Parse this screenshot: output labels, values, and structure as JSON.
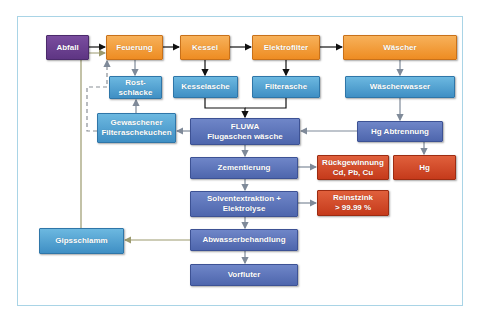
{
  "diagram": {
    "title": "",
    "nodes": {
      "abfall": "Abfall",
      "feuerung": "Feuerung",
      "kessel": "Kessel",
      "elektrofilter": "Elektrofilter",
      "waescher": "Wäscher",
      "rostschlacke_1": "Rost-",
      "rostschlacke_2": "schlacke",
      "kesselasche": "Kesselasche",
      "filterasche": "Filterasche",
      "waescherwasser": "Wäscherwasser",
      "gewaschener_1": "Gewaschener",
      "gewaschener_2": "Filteraschekuchen",
      "fluwa_1": "FLUWA",
      "fluwa_2": "Flugaschen wäsche",
      "hg_abtrennung": "Hg Abtrennung",
      "zementierung": "Zementierung",
      "rueckgewinnung_1": "Rückgewinnung",
      "rueckgewinnung_2": "Cd, Pb, Cu",
      "hg": "Hg",
      "solvent_1": "Solventextraktion +",
      "solvent_2": "Elektrolyse",
      "reinstzink_1": "Reinstzink",
      "reinstzink_2": "> 99.99 %",
      "gipsschlamm": "Gipsschlamm",
      "abwasser": "Abwasserbehandlung",
      "vorfluter": "Vorfluter"
    },
    "edges": [
      {
        "from": "Abfall",
        "to": "Feuerung",
        "style": "solid-black"
      },
      {
        "from": "Feuerung",
        "to": "Kessel",
        "style": "solid-black"
      },
      {
        "from": "Kessel",
        "to": "Elektrofilter",
        "style": "solid-black"
      },
      {
        "from": "Elektrofilter",
        "to": "Wäscher",
        "style": "solid-black"
      },
      {
        "from": "Feuerung",
        "to": "Rost-schlacke",
        "style": "grey"
      },
      {
        "from": "Kessel",
        "to": "Kesselasche",
        "style": "solid-black"
      },
      {
        "from": "Elektrofilter",
        "to": "Filterasche",
        "style": "solid-black"
      },
      {
        "from": "Kesselasche",
        "to": "FLUWA",
        "style": "solid-black"
      },
      {
        "from": "Filterasche",
        "to": "FLUWA",
        "style": "solid-black"
      },
      {
        "from": "Wäscher",
        "to": "Wäscherwasser",
        "style": "grey"
      },
      {
        "from": "Wäscherwasser",
        "to": "Hg Abtrennung",
        "style": "grey"
      },
      {
        "from": "Hg Abtrennung",
        "to": "FLUWA",
        "style": "grey"
      },
      {
        "from": "Hg Abtrennung",
        "to": "Hg",
        "style": "grey"
      },
      {
        "from": "FLUWA",
        "to": "Gewaschener Filteraschekuchen",
        "style": "grey"
      },
      {
        "from": "Gewaschener Filteraschekuchen",
        "to": "Rost-schlacke",
        "style": "grey"
      },
      {
        "from": "Gewaschener Filteraschekuchen",
        "to": "Feuerung",
        "style": "dashed-grey"
      },
      {
        "from": "FLUWA",
        "to": "Zementierung",
        "style": "grey"
      },
      {
        "from": "Zementierung",
        "to": "Rückgewinnung Cd, Pb, Cu",
        "style": "grey"
      },
      {
        "from": "Zementierung",
        "to": "Solventextraktion + Elektrolyse",
        "style": "grey"
      },
      {
        "from": "Solventextraktion + Elektrolyse",
        "to": "Reinstzink > 99.99 %",
        "style": "grey"
      },
      {
        "from": "Solventextraktion + Elektrolyse",
        "to": "Abwasserbehandlung",
        "style": "grey"
      },
      {
        "from": "Abwasserbehandlung",
        "to": "Gipsschlamm",
        "style": "olive"
      },
      {
        "from": "Gipsschlamm",
        "to": "Feuerung",
        "style": "olive"
      },
      {
        "from": "Abwasserbehandlung",
        "to": "Vorfluter",
        "style": "grey"
      }
    ],
    "colors": {
      "input": "#6a3f92",
      "process": "#f09a34",
      "residue": "#4e9fd2",
      "treatment": "#5a72b9",
      "product": "#cf4627",
      "frame": "#a9d4e6"
    }
  }
}
